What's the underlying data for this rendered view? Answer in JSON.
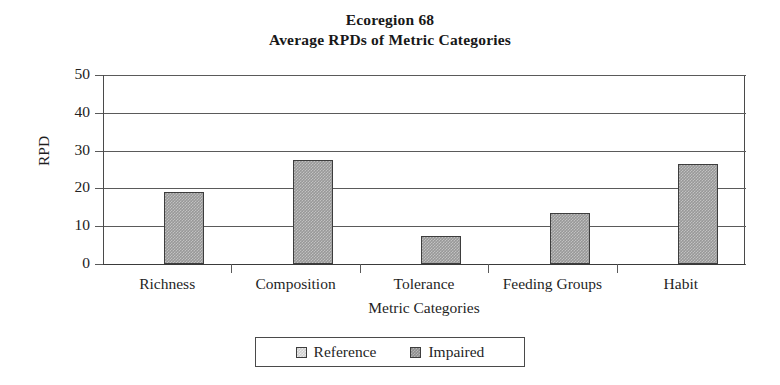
{
  "chart_data": {
    "type": "bar",
    "title": "Ecoregion 68",
    "subtitle": "Average RPDs of Metric Categories",
    "xlabel": "Metric Categories",
    "ylabel": "RPD",
    "categories": [
      "Richness",
      "Composition",
      "Tolerance",
      "Feeding Groups",
      "Habit"
    ],
    "ylim": [
      0,
      50
    ],
    "yticks": [
      0,
      10,
      20,
      30,
      40,
      50
    ],
    "ytick_labels": [
      "0",
      "10",
      "20",
      "30",
      "40",
      "50"
    ],
    "grid": "horizontal",
    "legend_position": "bottom-center",
    "series": [
      {
        "name": "Reference",
        "color": "#cfcfcf",
        "values": [
          0,
          0,
          0,
          0,
          0
        ]
      },
      {
        "name": "Impaired",
        "color": "#989898",
        "values": [
          19,
          27.5,
          7.4,
          13.4,
          26.4
        ]
      }
    ]
  },
  "legend": {
    "entries": [
      {
        "label": "Reference",
        "swatch": "swatch-reference"
      },
      {
        "label": "Impaired",
        "swatch": "swatch-impaired"
      }
    ]
  }
}
